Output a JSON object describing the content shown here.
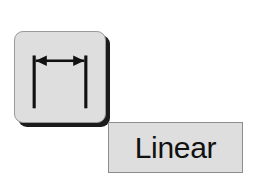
{
  "canvas": {
    "background_color": "#ffffff",
    "width": 261,
    "height": 188
  },
  "tool_button": {
    "name": "linear-dimension-tool",
    "state": "normal",
    "fill_color": "#dedede",
    "border_color": "#9a9a9a",
    "shadow_color": "#1b1b1b",
    "icon": {
      "semantic_name": "linear-dimension-icon",
      "description": "horizontal double-headed arrow between two vertical extension lines",
      "stroke_color": "#111111"
    }
  },
  "tooltip": {
    "name": "tool-tooltip",
    "label": "Linear",
    "fill_color": "#dedede",
    "border_color": "#8d8d8d",
    "text_color": "#111111"
  }
}
